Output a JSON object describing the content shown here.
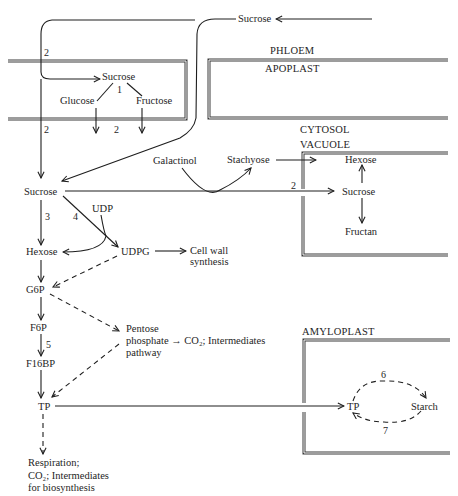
{
  "diagram": {
    "compartments": {
      "phloem": "PHLOEM",
      "apoplast": "APOPLAST",
      "cytosol": "CYTOSOL",
      "vacuole": "VACUOLE",
      "amyloplast": "AMYLOPLAST"
    },
    "nodes": {
      "sucrose_phloem": "Sucrose",
      "sucrose_apoplast": "Sucrose",
      "glucose": "Glucose",
      "fructose": "Fructose",
      "galactinol": "Galactinol",
      "stachyose": "Stachyose",
      "sucrose_cytosol": "Sucrose",
      "udp": "UDP",
      "hexose_cytosol": "Hexose",
      "udpg": "UDPG",
      "cell_wall_1": "Cell wall",
      "cell_wall_2": "synthesis",
      "g6p": "G6P",
      "f6p": "F6P",
      "f16bp": "F16BP",
      "tp_cytosol": "TP",
      "pentose_1": "Pentose",
      "pentose_2": "phosphate → CO₂; Intermediates",
      "pentose_3": "pathway",
      "respiration_1": "Respiration;",
      "respiration_2": "CO₂; Intermediates",
      "respiration_3": "for biosynthesis",
      "hexose_vacuole": "Hexose",
      "sucrose_vacuole": "Sucrose",
      "fructan": "Fructan",
      "tp_amyloplast": "TP",
      "starch": "Starch"
    },
    "step_numbers": {
      "phloem_unload": "2",
      "invertase": "1",
      "apoplast_transport_left": "2",
      "glucose_uptake": "2",
      "cytosol_entry": "2",
      "invertase_cytosol": "3",
      "sucrose_synthase": "4",
      "pfk": "5",
      "vacuole_transport": "2",
      "starch_synthesis": "6",
      "starch_degradation": "7"
    },
    "colors": {
      "ink": "#1e1e1e",
      "membrane": "#3a3a3a",
      "background": "#ffffff"
    }
  }
}
